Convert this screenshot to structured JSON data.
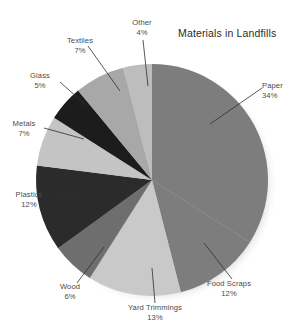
{
  "chart_data": {
    "type": "pie",
    "title": "Materials in Landfills",
    "xlabel": "",
    "ylabel": "",
    "legend_position": "none",
    "grid": false,
    "units": "percent",
    "start_angle_deg": 0,
    "direction": "clockwise",
    "categories": [
      "Paper",
      "Food Scraps",
      "Yard Trimmings",
      "Wood",
      "Plastics",
      "Metals",
      "Glass",
      "Textiles",
      "Other"
    ],
    "values": [
      34,
      12,
      13,
      6,
      12,
      7,
      5,
      7,
      4
    ],
    "labels": [
      "34%",
      "12%",
      "13%",
      "6%",
      "12%",
      "7%",
      "5%",
      "7%",
      "4%"
    ],
    "colors": [
      "#7d7d7d",
      "#7d7d7d",
      "#c9c9c9",
      "#6e6e6e",
      "#2b2b2b",
      "#c4c4c4",
      "#1c1c1c",
      "#a8a8a8",
      "#bdbdbd"
    ],
    "slices": [
      {
        "name": "Paper",
        "value": 34,
        "pct_label": "34%",
        "color": "#7d7d7d"
      },
      {
        "name": "Food Scraps",
        "value": 12,
        "pct_label": "12%",
        "color": "#7d7d7d"
      },
      {
        "name": "Yard Trimmings",
        "value": 13,
        "pct_label": "13%",
        "color": "#c9c9c9"
      },
      {
        "name": "Wood",
        "value": 6,
        "pct_label": "6%",
        "color": "#6e6e6e"
      },
      {
        "name": "Plastics",
        "value": 12,
        "pct_label": "12%",
        "color": "#2b2b2b"
      },
      {
        "name": "Metals",
        "value": 7,
        "pct_label": "7%",
        "color": "#c4c4c4"
      },
      {
        "name": "Glass",
        "value": 5,
        "pct_label": "5%",
        "color": "#1c1c1c"
      },
      {
        "name": "Textiles",
        "value": 7,
        "pct_label": "7%",
        "color": "#a8a8a8"
      },
      {
        "name": "Other",
        "value": 4,
        "pct_label": "4%",
        "color": "#bdbdbd"
      }
    ]
  },
  "labels": {
    "paper": {
      "name": "Paper",
      "pct": "34%"
    },
    "food_scraps": {
      "name": "Food Scraps",
      "pct": "12%"
    },
    "yard_trimmings": {
      "name": "Yard Trimmings",
      "pct": "13%"
    },
    "wood": {
      "name": "Wood",
      "pct": "6%"
    },
    "plastics": {
      "name": "Plastics",
      "pct": "12%"
    },
    "metals": {
      "name": "Metals",
      "pct": "7%"
    },
    "glass": {
      "name": "Glass",
      "pct": "5%"
    },
    "textiles": {
      "name": "Textiles",
      "pct": "7%"
    },
    "other": {
      "name": "Other",
      "pct": "4%"
    }
  },
  "style": {
    "background": "#ffffff",
    "title_color": "#2a2a2a",
    "label_color": "#4a4a4a",
    "leader_color": "#2e2e2e"
  }
}
